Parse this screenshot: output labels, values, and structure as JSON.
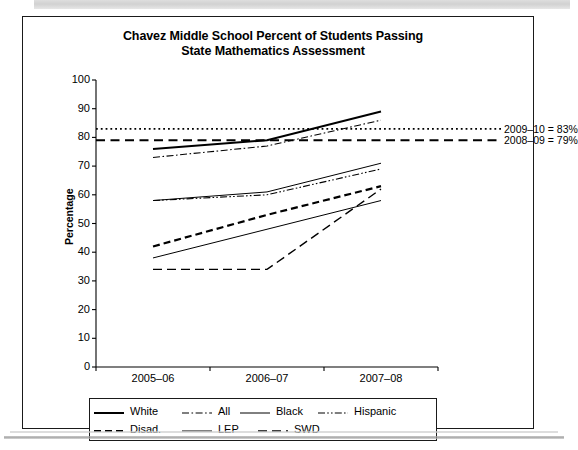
{
  "figure": {
    "title_line1": "Chavez Middle School Percent of Students Passing",
    "title_line2": "State Mathematics Assessment"
  },
  "annotations": {
    "target_2009_10": "2009–10 = 83%",
    "target_2008_09": "2008–09 = 79%"
  },
  "legend": {
    "row1": [
      {
        "label": "White",
        "style": "solid-thick"
      },
      {
        "label": "All",
        "style": "dash-dot"
      },
      {
        "label": "Black",
        "style": "solid-thin"
      },
      {
        "label": "Hispanic",
        "style": "dash-dot-dot"
      }
    ],
    "row2": [
      {
        "label": "Disad.",
        "style": "dashed-thick"
      },
      {
        "label": "LEP",
        "style": "solid-thin"
      },
      {
        "label": "SWD",
        "style": "long-dash"
      }
    ]
  },
  "chart_data": {
    "type": "line",
    "title": "Chavez Middle School Percent of Students Passing State Mathematics Assessment",
    "xlabel": "",
    "ylabel": "Percentage",
    "categories": [
      "2005–06",
      "2006–07",
      "2007–08"
    ],
    "ylim": [
      0,
      100
    ],
    "yticks": [
      0,
      10,
      20,
      30,
      40,
      50,
      60,
      70,
      80,
      90,
      100
    ],
    "ytick_labels": [
      "0",
      "10",
      "20",
      "30",
      "40",
      "50",
      "60",
      "70",
      "80",
      "90",
      "100"
    ],
    "grid": false,
    "legend_position": "below-plot",
    "series": [
      {
        "name": "White",
        "style": "solid-thick",
        "values": [
          76,
          79,
          89
        ]
      },
      {
        "name": "All",
        "style": "dash-dot",
        "values": [
          73,
          77,
          86
        ]
      },
      {
        "name": "Black",
        "style": "solid-thin",
        "values": [
          58,
          61,
          71
        ]
      },
      {
        "name": "Hispanic",
        "style": "dash-dot-dot",
        "values": [
          58,
          60,
          69
        ]
      },
      {
        "name": "Disad.",
        "style": "dashed-thick",
        "values": [
          42,
          53,
          63
        ]
      },
      {
        "name": "LEP",
        "style": "solid-thin",
        "values": [
          38,
          48,
          58
        ]
      },
      {
        "name": "SWD",
        "style": "long-dash",
        "values": [
          34,
          34,
          62
        ]
      }
    ],
    "reference_lines": [
      {
        "name": "2009–10 target",
        "value": 83,
        "style": "dotted",
        "label": "2009–10 = 83%"
      },
      {
        "name": "2008–09 target",
        "value": 79,
        "style": "dashed",
        "label": "2008–09 = 79%"
      }
    ]
  }
}
